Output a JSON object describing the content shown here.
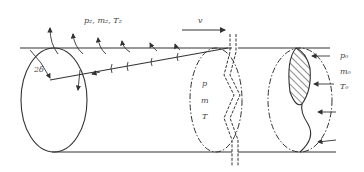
{
  "diagram": {
    "title": "",
    "labels": {
      "ambient": "p₂, m₂, T₂",
      "velocity": "v",
      "angle": "2δ",
      "inner_p": "p",
      "inner_m": "m",
      "inner_T": "T",
      "inlet_p": "p₀",
      "inlet_m": "m₀",
      "inlet_T": "T₀"
    },
    "colors": {
      "stroke": "#333333",
      "text": "#444444",
      "background": "#ffffff"
    }
  }
}
